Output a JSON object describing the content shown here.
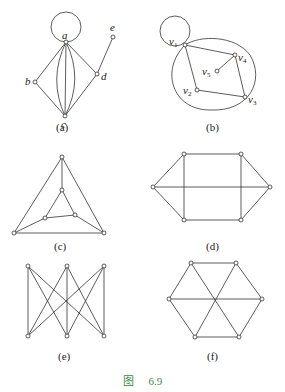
{
  "figure": {
    "caption_prefix": "图",
    "caption_number": "6.9",
    "caption_color": "#3a8a3a",
    "subfigures": [
      {
        "id": "a",
        "label": "(a)",
        "vertices": [
          "a",
          "b",
          "c",
          "d",
          "e"
        ],
        "edges": [
          [
            "a",
            "a",
            "loop"
          ],
          [
            "a",
            "b"
          ],
          [
            "a",
            "c"
          ],
          [
            "a",
            "c"
          ],
          [
            "a",
            "c"
          ],
          [
            "a",
            "d"
          ],
          [
            "b",
            "c"
          ],
          [
            "c",
            "d"
          ],
          [
            "d",
            "e"
          ]
        ]
      },
      {
        "id": "b",
        "label": "(b)",
        "vertices": [
          "v1",
          "v2",
          "v3",
          "v4",
          "v5"
        ],
        "edges": [
          [
            "v1",
            "v1",
            "loop"
          ],
          [
            "v1",
            "v2"
          ],
          [
            "v1",
            "v4"
          ],
          [
            "v2",
            "v3"
          ],
          [
            "v4",
            "v3"
          ],
          [
            "v4",
            "v5"
          ],
          [
            "v1",
            "v3",
            "outer-curve"
          ]
        ]
      },
      {
        "id": "c",
        "label": "(c)"
      },
      {
        "id": "d",
        "label": "(d)"
      },
      {
        "id": "e",
        "label": "(e)"
      },
      {
        "id": "f",
        "label": "(f)"
      }
    ],
    "vertex_labels": {
      "a": "a",
      "b": "b",
      "c": "c",
      "d": "d",
      "e": "e",
      "v1": "v",
      "v2": "v",
      "v3": "v",
      "v4": "v",
      "v5": "v",
      "v1_sub": "1",
      "v2_sub": "2",
      "v3_sub": "3",
      "v4_sub": "4",
      "v5_sub": "5"
    }
  }
}
